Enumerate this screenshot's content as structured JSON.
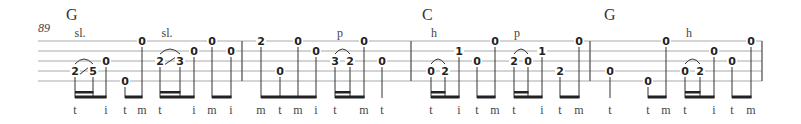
{
  "measure_number": "89",
  "staff": {
    "left": 38,
    "right": 762,
    "string_y": [
      41,
      51,
      61,
      71,
      81
    ],
    "line_color": "#aaaaaa",
    "barlines": [
      242,
      411,
      590,
      762
    ]
  },
  "chords": [
    {
      "label": "G",
      "x": 72
    },
    {
      "label": "C",
      "x": 428
    },
    {
      "label": "G",
      "x": 610
    }
  ],
  "technique_labels": [
    {
      "label": "sl.",
      "x": 80
    },
    {
      "label": "sl.",
      "x": 167
    },
    {
      "label": "p",
      "x": 340
    },
    {
      "label": "h",
      "x": 434
    },
    {
      "label": "p",
      "x": 517
    },
    {
      "label": "h",
      "x": 689
    }
  ],
  "measures": [
    {
      "chord": "G",
      "notes": [
        {
          "fret": "2",
          "string": 4,
          "x": 72,
          "pick": "t"
        },
        {
          "fret": "5",
          "string": 4,
          "x": 90,
          "pick": ""
        },
        {
          "fret": "0",
          "string": 3,
          "x": 103,
          "pick": "i"
        },
        {
          "fret": "0",
          "string": 5,
          "x": 122,
          "pick": "t"
        },
        {
          "fret": "0",
          "string": 1,
          "x": 139,
          "pick": "m"
        },
        {
          "fret": "2",
          "string": 3,
          "x": 157,
          "pick": "t"
        },
        {
          "fret": "3",
          "string": 3,
          "x": 177,
          "pick": ""
        },
        {
          "fret": "0",
          "string": 2,
          "x": 191,
          "pick": "i"
        },
        {
          "fret": "0",
          "string": 1,
          "x": 209,
          "pick": "m"
        },
        {
          "fret": "0",
          "string": 2,
          "x": 228,
          "pick": "i"
        }
      ]
    },
    {
      "chord": "",
      "notes": [
        {
          "fret": "2",
          "string": 1,
          "x": 258,
          "pick": "m"
        },
        {
          "fret": "0",
          "string": 4,
          "x": 277,
          "pick": "t"
        },
        {
          "fret": "0",
          "string": 1,
          "x": 295,
          "pick": "m"
        },
        {
          "fret": "0",
          "string": 2,
          "x": 313,
          "pick": "i"
        },
        {
          "fret": "3",
          "string": 3,
          "x": 332,
          "pick": "t"
        },
        {
          "fret": "2",
          "string": 3,
          "x": 347,
          "pick": ""
        },
        {
          "fret": "0",
          "string": 1,
          "x": 361,
          "pick": "m"
        },
        {
          "fret": "0",
          "string": 3,
          "x": 379,
          "pick": "t"
        }
      ]
    },
    {
      "chord": "C",
      "notes": [
        {
          "fret": "0",
          "string": 4,
          "x": 428,
          "pick": "t"
        },
        {
          "fret": "2",
          "string": 4,
          "x": 442,
          "pick": ""
        },
        {
          "fret": "1",
          "string": 2,
          "x": 456,
          "pick": "i"
        },
        {
          "fret": "0",
          "string": 3,
          "x": 474,
          "pick": "t"
        },
        {
          "fret": "0",
          "string": 1,
          "x": 492,
          "pick": "m"
        },
        {
          "fret": "2",
          "string": 3,
          "x": 511,
          "pick": "t"
        },
        {
          "fret": "0",
          "string": 3,
          "x": 525,
          "pick": ""
        },
        {
          "fret": "1",
          "string": 2,
          "x": 539,
          "pick": "i"
        },
        {
          "fret": "2",
          "string": 4,
          "x": 557,
          "pick": "t"
        },
        {
          "fret": "0",
          "string": 1,
          "x": 576,
          "pick": "m"
        }
      ]
    },
    {
      "chord": "G",
      "notes": [
        {
          "fret": "0",
          "string": 4,
          "x": 607,
          "pick": "t"
        },
        {
          "fret": "0",
          "string": 5,
          "x": 645,
          "pick": "t"
        },
        {
          "fret": "0",
          "string": 1,
          "x": 663,
          "pick": "m"
        },
        {
          "fret": "0",
          "string": 4,
          "x": 682,
          "pick": "t"
        },
        {
          "fret": "2",
          "string": 4,
          "x": 697,
          "pick": ""
        },
        {
          "fret": "0",
          "string": 2,
          "x": 711,
          "pick": "i"
        },
        {
          "fret": "0",
          "string": 3,
          "x": 729,
          "pick": "t"
        },
        {
          "fret": "0",
          "string": 1,
          "x": 748,
          "pick": "m"
        }
      ]
    }
  ],
  "beams": [
    {
      "x1": 72,
      "x2": 103,
      "sub": [
        72,
        90
      ]
    },
    {
      "x1": 122,
      "x2": 139,
      "sub": null
    },
    {
      "x1": 157,
      "x2": 191,
      "sub": [
        157,
        177
      ]
    },
    {
      "x1": 209,
      "x2": 228,
      "sub": null
    },
    {
      "x1": 258,
      "x2": 313,
      "sub": null
    },
    {
      "x1": 332,
      "x2": 361,
      "sub": [
        332,
        347
      ]
    },
    {
      "x1": 428,
      "x2": 456,
      "sub": [
        428,
        442
      ]
    },
    {
      "x1": 474,
      "x2": 492,
      "sub": null
    },
    {
      "x1": 511,
      "x2": 539,
      "sub": [
        511,
        525
      ]
    },
    {
      "x1": 557,
      "x2": 576,
      "sub": null
    },
    {
      "x1": 645,
      "x2": 663,
      "sub": null
    },
    {
      "x1": 682,
      "x2": 711,
      "sub": [
        682,
        697
      ]
    },
    {
      "x1": 729,
      "x2": 748,
      "sub": null
    }
  ],
  "slurs": [
    {
      "x1": 72,
      "x2": 90,
      "string": 4,
      "slide": true
    },
    {
      "x1": 157,
      "x2": 177,
      "string": 3,
      "slide": true
    },
    {
      "x1": 332,
      "x2": 347,
      "string": 3,
      "slide": false
    },
    {
      "x1": 428,
      "x2": 442,
      "string": 4,
      "slide": false
    },
    {
      "x1": 511,
      "x2": 525,
      "string": 3,
      "slide": false
    },
    {
      "x1": 682,
      "x2": 697,
      "string": 4,
      "slide": false
    }
  ]
}
